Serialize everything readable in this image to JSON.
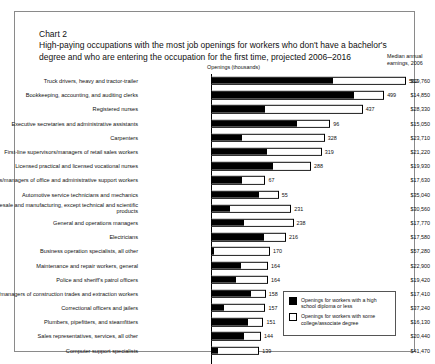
{
  "chart_label": "Chart 2",
  "title": "High-paying occupations with the most job openings for workers who don't have a bachelor's degree and who are entering the occupation for the first time, projected 2006–2016",
  "columns": {
    "openings": "Openings (thousands)",
    "earnings": "Median annual earnings, 2006"
  },
  "legend": {
    "high_school": "Openings for workers with a high school diploma or less",
    "some_college": "Openings for workers with some college/associate degree"
  },
  "chart_data": {
    "type": "bar",
    "title": "High-paying occupations with the most job openings for workers who don't have a bachelor's degree and who are entering the occupation for the first time, projected 2006–2016",
    "xlabel": "Openings (thousands)",
    "ylabel": "",
    "orientation": "horizontal",
    "stacked": true,
    "grid": false,
    "legend_position": "inside-bottom-right",
    "xlim": [
      0,
      560
    ],
    "categories": [
      "Truck drivers, heavy and tractor-trailer",
      "Bookkeeping, accounting, and auditing clerks",
      "Registered nurses",
      "Executive secretaries and administrative assistants",
      "Carpenters",
      "First-line supervisors/managers of retail sales workers",
      "Licensed practical and licensed vocational nurses",
      "First-line supervisors/managers of office and administrative support workers",
      "Automotive service technicians and mechanics",
      "Sales representatives, wholesale and manufacturing, except technical and scientific products",
      "General and operations managers",
      "Electricians",
      "Business operation specialists, all other",
      "Maintenance and repair workers, general",
      "Police and sheriff's patrol officers",
      "First-line supervisors/managers of construction trades and extraction workers",
      "Correctional officers and jailers",
      "Plumbers, pipefitters, and steamfitters",
      "Sales representatives, services, all other",
      "Computer support specialists"
    ],
    "series": [
      {
        "name": "Openings for workers with a high school diploma or less",
        "values": [
          352,
          413,
          155,
          248,
          89,
          160,
          180,
          90,
          140,
          52,
          95,
          155,
          6,
          88,
          72,
          118,
          36,
          107,
          95,
          18
        ]
      },
      {
        "name": "Openings for workers with some college/associate degree",
        "values": [
          210,
          86,
          282,
          96,
          239,
          159,
          108,
          67,
          55,
          179,
          143,
          61,
          164,
          76,
          92,
          40,
          121,
          44,
          49,
          121
        ]
      }
    ],
    "totals": [
      562,
      499,
      437,
      344,
      328,
      319,
      288,
      157,
      195,
      231,
      238,
      216,
      170,
      164,
      164,
      158,
      157,
      151,
      144,
      139
    ],
    "total_labels": [
      "562",
      "499",
      "437",
      "96",
      "328",
      "319",
      "288",
      "67",
      "55",
      "231",
      "238",
      "216",
      "170",
      "164",
      "164",
      "158",
      "157",
      "151",
      "144",
      "139"
    ],
    "earnings_label": "Median annual earnings, 2006",
    "earnings": [
      "$19,760",
      "$14,850",
      "$28,330",
      "$15,050",
      "$23,710",
      "$21,220",
      "$19,930",
      "$17,630",
      "$35,040",
      "$30,560",
      "$17,770",
      "$17,580",
      "$57,280",
      "$22,900",
      "$19,420",
      "$17,410",
      "$37,240",
      "$16,130",
      "$20,440",
      "$41,470"
    ]
  },
  "rows": [
    {
      "occ": "Truck drivers, heavy and tractor-trailer",
      "hs": 352,
      "col": 210,
      "label": "562",
      "earn": "$19,760"
    },
    {
      "occ": "Bookkeeping, accounting, and auditing clerks",
      "hs": 413,
      "col": 86,
      "label": "499",
      "earn": "$14,850"
    },
    {
      "occ": "Registered nurses",
      "hs": 155,
      "col": 282,
      "label": "437",
      "earn": "$28,330"
    },
    {
      "occ": "Executive secretaries and administrative assistants",
      "hs": 248,
      "col": 96,
      "label": "96",
      "earn": "$15,050"
    },
    {
      "occ": "Carpenters",
      "hs": 89,
      "col": 239,
      "label": "328",
      "earn": "$23,710"
    },
    {
      "occ": "First-line supervisors/managers of retail sales workers",
      "hs": 160,
      "col": 159,
      "label": "319",
      "earn": "$21,220"
    },
    {
      "occ": "Licensed practical and licensed vocational nurses",
      "hs": 180,
      "col": 108,
      "label": "288",
      "earn": "$19,930"
    },
    {
      "occ": "First-line supervisors/managers of office and administrative support workers",
      "hs": 90,
      "col": 67,
      "label": "67",
      "earn": "$17,630"
    },
    {
      "occ": "Automotive service technicians and mechanics",
      "hs": 140,
      "col": 55,
      "label": "55",
      "earn": "$35,040"
    },
    {
      "occ": "Sales representatives, wholesale and manufacturing, except technical and scientific products",
      "hs": 52,
      "col": 179,
      "label": "231",
      "earn": "$30,560"
    },
    {
      "occ": "General and operations managers",
      "hs": 95,
      "col": 143,
      "label": "238",
      "earn": "$17,770"
    },
    {
      "occ": "Electricians",
      "hs": 155,
      "col": 61,
      "label": "216",
      "earn": "$17,580"
    },
    {
      "occ": "Business operation specialists, all other",
      "hs": 6,
      "col": 164,
      "label": "170",
      "earn": "$57,280"
    },
    {
      "occ": "Maintenance and repair workers, general",
      "hs": 88,
      "col": 76,
      "label": "164",
      "earn": "$22,900"
    },
    {
      "occ": "Police and sheriff's patrol officers",
      "hs": 72,
      "col": 92,
      "label": "164",
      "earn": "$19,420"
    },
    {
      "occ": "First-line supervisors/managers of construction trades and extraction workers",
      "hs": 118,
      "col": 40,
      "label": "158",
      "earn": "$17,410"
    },
    {
      "occ": "Correctional officers and jailers",
      "hs": 36,
      "col": 121,
      "label": "157",
      "earn": "$37,240"
    },
    {
      "occ": "Plumbers, pipefitters, and steamfitters",
      "hs": 107,
      "col": 44,
      "label": "151",
      "earn": "$16,130"
    },
    {
      "occ": "Sales representatives, services, all other",
      "hs": 95,
      "col": 49,
      "label": "144",
      "earn": "$20,440"
    },
    {
      "occ": "Computer support specialists",
      "hs": 18,
      "col": 121,
      "label": "139",
      "earn": "$41,470"
    }
  ]
}
